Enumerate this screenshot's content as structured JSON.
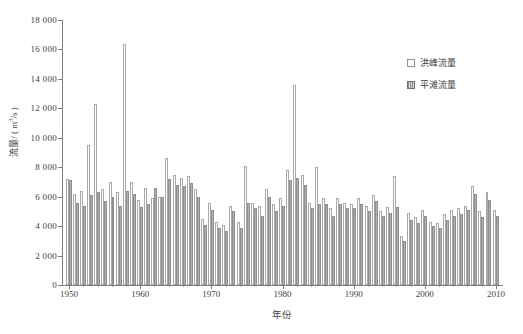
{
  "chart_data": {
    "type": "bar",
    "title": "",
    "subtitle": "",
    "xlabel": "年份",
    "ylabel": "流量/ ( m3/s )",
    "ylabel_parts": {
      "prefix": "流量/ ( m",
      "exponent": "3",
      "suffix": "/s )"
    },
    "xlim": [
      1949,
      2011
    ],
    "ylim": [
      0,
      18000
    ],
    "ytick_step": 2000,
    "grid": false,
    "legend_position": "top-right",
    "x": [
      1950,
      1951,
      1952,
      1953,
      1954,
      1955,
      1956,
      1957,
      1958,
      1959,
      1960,
      1961,
      1962,
      1963,
      1964,
      1965,
      1966,
      1967,
      1968,
      1969,
      1970,
      1971,
      1972,
      1973,
      1974,
      1975,
      1976,
      1977,
      1978,
      1979,
      1980,
      1981,
      1982,
      1983,
      1984,
      1985,
      1986,
      1987,
      1988,
      1989,
      1990,
      1991,
      1992,
      1993,
      1994,
      1995,
      1996,
      1997,
      1998,
      1999,
      2000,
      2001,
      2002,
      2003,
      2004,
      2005,
      2006,
      2007,
      2008,
      2009,
      2010
    ],
    "categories": [
      "1950",
      "1951",
      "1952",
      "1953",
      "1954",
      "1955",
      "1956",
      "1957",
      "1958",
      "1959",
      "1960",
      "1961",
      "1962",
      "1963",
      "1964",
      "1965",
      "1966",
      "1967",
      "1968",
      "1969",
      "1970",
      "1971",
      "1972",
      "1973",
      "1974",
      "1975",
      "1976",
      "1977",
      "1978",
      "1979",
      "1980",
      "1981",
      "1982",
      "1983",
      "1984",
      "1985",
      "1986",
      "1987",
      "1988",
      "1989",
      "1990",
      "1991",
      "1992",
      "1993",
      "1994",
      "1995",
      "1996",
      "1997",
      "1998",
      "1999",
      "2000",
      "2001",
      "2002",
      "2003",
      "2004",
      "2005",
      "2006",
      "2007",
      "2008",
      "2009",
      "2010"
    ],
    "xticks": [
      1950,
      1960,
      1970,
      1980,
      1990,
      2000,
      2010
    ],
    "xtick_labels": [
      "1950",
      "1960",
      "1970",
      "1980",
      "1990",
      "2000",
      "2010"
    ],
    "yticks": [
      0,
      2000,
      4000,
      6000,
      8000,
      10000,
      12000,
      14000,
      16000,
      18000
    ],
    "ytick_labels": [
      "0",
      "2 000",
      "4 000",
      "6 000",
      "8 000",
      "10 000",
      "12 000",
      "14 000",
      "16 000",
      "18 000"
    ],
    "series": [
      {
        "name": "洪峰流量",
        "style": "open",
        "color": "#ffffff",
        "edge_color": "#a9a9a9",
        "values": [
          7200,
          6200,
          6400,
          9500,
          12300,
          6500,
          7000,
          6300,
          16400,
          7000,
          5800,
          6600,
          5900,
          6000,
          8600,
          7500,
          7300,
          7400,
          6500,
          4500,
          5600,
          4300,
          4100,
          5400,
          4300,
          8100,
          5600,
          5400,
          6500,
          5500,
          5900,
          7800,
          13600,
          7500,
          5600,
          8000,
          5900,
          5200,
          5900,
          5600,
          5500,
          5900,
          5400,
          6100,
          5000,
          5300,
          7400,
          3300,
          4900,
          4600,
          5100,
          4300,
          4200,
          4800,
          5100,
          5200,
          5400,
          6700,
          5000,
          6300,
          5100
        ]
      },
      {
        "name": "平滩流量",
        "style": "hatched",
        "color": "#c2c2c2",
        "edge_color": "#8e8e8e",
        "values": [
          7100,
          5600,
          5400,
          6100,
          6300,
          5700,
          6000,
          5400,
          6400,
          6200,
          5300,
          5500,
          6600,
          6000,
          7200,
          6800,
          6700,
          6900,
          6000,
          4100,
          5100,
          3900,
          3700,
          5000,
          3900,
          5600,
          5200,
          4700,
          6000,
          5000,
          5400,
          7100,
          7300,
          6800,
          5200,
          5500,
          5500,
          4700,
          5500,
          5200,
          5200,
          5500,
          5000,
          5700,
          4700,
          4900,
          5300,
          3000,
          4400,
          4200,
          4700,
          4000,
          3900,
          4400,
          4700,
          4800,
          5100,
          6200,
          4600,
          5800,
          4700
        ]
      }
    ],
    "notes": {
      "peak_max_year": "1958",
      "peak_max_value": 16400,
      "second_peak_year": "1982",
      "second_peak_value": 13600
    }
  },
  "legend": {
    "entries": [
      {
        "label": "洪峰流量",
        "swatch": "open-square-icon"
      },
      {
        "label": "平滩流量",
        "swatch": "hatched-square-icon"
      }
    ]
  }
}
